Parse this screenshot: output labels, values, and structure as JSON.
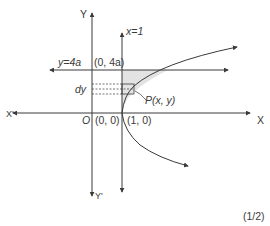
{
  "diagram": {
    "type": "parabola-area-figure",
    "labels": {
      "y_axis_top": "Y",
      "y_axis_bottom": "Y'",
      "x_axis_right": "X",
      "x_axis_left": "X'",
      "origin": "O",
      "origin_coords": "(0, 0)",
      "vertex_coords": "(1, 0)",
      "line_x1": "x=1",
      "line_y4a": "y=4a",
      "point_04a": "(0, 4a)",
      "strip": "dy",
      "point_P": "P(x, y)",
      "marks": "(1/2)"
    },
    "colors": {
      "line": "#3a3a3a",
      "shade": "#e3e3e3",
      "background": "#ffffff"
    }
  }
}
